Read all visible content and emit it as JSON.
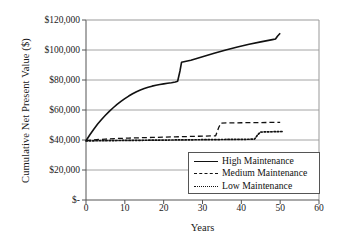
{
  "chart_data": {
    "type": "line",
    "title": "",
    "xlabel": "Years",
    "ylabel": "Cumulative Net Present Value ($)",
    "xlim": [
      0,
      60
    ],
    "ylim": [
      0,
      120000
    ],
    "grid": true,
    "legend_position": "inside-bottom-right",
    "x_ticks": [
      0,
      10,
      20,
      30,
      40,
      50,
      60
    ],
    "x_tick_labels": [
      "0",
      "10",
      "20",
      "30",
      "40",
      "50",
      "60"
    ],
    "y_ticks": [
      0,
      20000,
      40000,
      60000,
      80000,
      100000,
      120000
    ],
    "y_tick_labels": [
      "$-",
      "$20,000",
      "$40,000",
      "$60,000",
      "$80,000",
      "$100,000",
      "$120,000"
    ],
    "series": [
      {
        "name": "High Maintenance",
        "style": "solid",
        "color": "#111111",
        "points": [
          [
            0,
            39500
          ],
          [
            1,
            43500
          ],
          [
            2,
            47200
          ],
          [
            3,
            50600
          ],
          [
            4,
            53700
          ],
          [
            5,
            56500
          ],
          [
            6,
            59100
          ],
          [
            7,
            61500
          ],
          [
            8,
            63700
          ],
          [
            9,
            65700
          ],
          [
            10,
            67600
          ],
          [
            11,
            69300
          ],
          [
            12,
            70800
          ],
          [
            13,
            72200
          ],
          [
            14,
            73400
          ],
          [
            15,
            74400
          ],
          [
            16,
            75200
          ],
          [
            17,
            75900
          ],
          [
            18,
            76500
          ],
          [
            19,
            77000
          ],
          [
            20,
            77400
          ],
          [
            21,
            77800
          ],
          [
            22,
            78200
          ],
          [
            23,
            78700
          ],
          [
            23.6,
            79200
          ],
          [
            24.2,
            86000
          ],
          [
            24.6,
            91800
          ],
          [
            25.5,
            92300
          ],
          [
            27,
            93200
          ],
          [
            30,
            95500
          ],
          [
            33,
            97800
          ],
          [
            36,
            100000
          ],
          [
            39,
            102000
          ],
          [
            42,
            103800
          ],
          [
            45,
            105400
          ],
          [
            48,
            106900
          ],
          [
            48.8,
            107300
          ],
          [
            49.3,
            109200
          ],
          [
            50,
            111200
          ]
        ]
      },
      {
        "name": "Medium Maintenance",
        "style": "dashed",
        "color": "#111111",
        "points": [
          [
            0,
            39500
          ],
          [
            2,
            40100
          ],
          [
            5,
            40600
          ],
          [
            8,
            41000
          ],
          [
            11,
            41300
          ],
          [
            14,
            41500
          ],
          [
            17,
            41700
          ],
          [
            20,
            41900
          ],
          [
            23,
            42100
          ],
          [
            26,
            42300
          ],
          [
            29,
            42500
          ],
          [
            32,
            42700
          ],
          [
            33.4,
            42800
          ],
          [
            34.2,
            48500
          ],
          [
            34.8,
            51300
          ],
          [
            37,
            51400
          ],
          [
            40,
            51500
          ],
          [
            44,
            51600
          ],
          [
            47,
            51700
          ],
          [
            50,
            51800
          ]
        ]
      },
      {
        "name": "Low Maintenance",
        "style": "dotted",
        "color": "#111111",
        "points": [
          [
            0,
            39400
          ],
          [
            3,
            39500
          ],
          [
            6,
            39600
          ],
          [
            10,
            39700
          ],
          [
            14,
            39800
          ],
          [
            18,
            39900
          ],
          [
            22,
            40000
          ],
          [
            26,
            40100
          ],
          [
            30,
            40200
          ],
          [
            34,
            40300
          ],
          [
            38,
            40400
          ],
          [
            42,
            40500
          ],
          [
            43.4,
            40600
          ],
          [
            44.2,
            43400
          ],
          [
            44.9,
            45300
          ],
          [
            46,
            45400
          ],
          [
            48,
            45500
          ],
          [
            50,
            45600
          ],
          [
            50.8,
            45700
          ]
        ]
      }
    ]
  },
  "legend": {
    "items": [
      {
        "label": "High Maintenance",
        "style": "solid"
      },
      {
        "label": "Medium Maintenance",
        "style": "dashed"
      },
      {
        "label": "Low Maintenance",
        "style": "dotted"
      }
    ]
  },
  "axes": {
    "x_title": "Years",
    "y_title": "Cumulative Net Present Value ($)"
  }
}
